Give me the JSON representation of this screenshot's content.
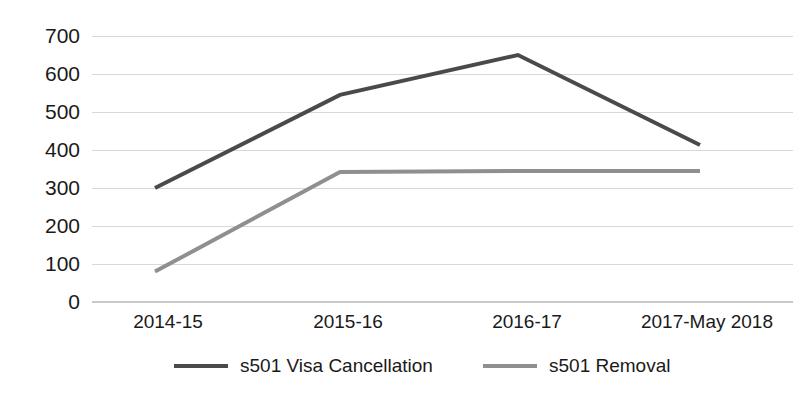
{
  "chart_data": {
    "type": "line",
    "title": "",
    "subtitle": "",
    "xlabel": "",
    "ylabel": "",
    "categories": [
      "2014-15",
      "2015-16",
      "2016-17",
      "2017-May 2018"
    ],
    "series": [
      {
        "name": "s501 Visa Cancellation",
        "color": "#4a4a4a",
        "values": [
          300,
          545,
          650,
          413
        ]
      },
      {
        "name": "s501 Removal",
        "color": "#8f8f8f",
        "values": [
          80,
          342,
          345,
          345
        ]
      }
    ],
    "ylim": [
      0,
      700
    ],
    "ytick_labels": [
      "700",
      "600",
      "500",
      "400",
      "300",
      "200",
      "100",
      "0"
    ],
    "ytick_values": [
      700,
      600,
      500,
      400,
      300,
      200,
      100,
      0
    ],
    "grid": true,
    "grid_axis": "y",
    "legend_position": "bottom",
    "legend": [
      {
        "label": "s501 Visa Cancellation",
        "color": "#4a4a4a"
      },
      {
        "label": "s501 Removal",
        "color": "#8f8f8f"
      }
    ],
    "annotations": []
  },
  "colors": {
    "background": "#ffffff",
    "gridline": "#d8d8d8",
    "axis": "#c9c9c9",
    "text": "#1a1a1a",
    "series_1": "#4a4a4a",
    "series_2": "#8f8f8f"
  }
}
